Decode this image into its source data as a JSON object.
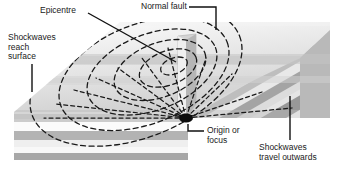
{
  "diagram": {
    "background_color": "#ffffff",
    "line_color": "#111111",
    "dash_color": "#1a1a1a"
  },
  "labels": {
    "epicentre": "Epicentre",
    "normal_fault": "Normal fault",
    "shockwaves_reach_surface": "Shockwaves\nreach\nsurface",
    "origin_or_focus": "Origin or\nfocus",
    "shockwaves_travel_outwards": "Shockwaves\ntravel outwards"
  },
  "strata": {
    "count": 7,
    "front_face_colors": [
      "#e9e9e9",
      "#cfcfcf",
      "#fafafa",
      "#b5b5b5",
      "#ededed",
      "#f7f7f7",
      "#a9a9a9"
    ],
    "side_face_colors": [
      "#d6d6d6",
      "#bcbcbc",
      "#e6e6e6",
      "#a2a2a2",
      "#dadada",
      "#e3e3e3",
      "#969696"
    ],
    "top_surface_color": "#e2e2e2"
  },
  "features": {
    "shockwave_rings": 6,
    "focus_rays": 11,
    "focus_point_color": "#0d0d0d",
    "fault_wedge_color": "#d0d0d0"
  }
}
